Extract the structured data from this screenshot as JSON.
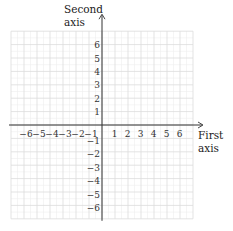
{
  "chart_data": {
    "type": "coordinate-plane",
    "title": "",
    "xlabel": [
      "First",
      "axis"
    ],
    "ylabel": [
      "Second",
      "axis"
    ],
    "xlim": [
      -7,
      7
    ],
    "ylim": [
      -7,
      7
    ],
    "grid": true,
    "minor_grid_step": 0.5,
    "major_grid_step": 1,
    "x_ticks": [
      -6,
      -5,
      -4,
      -3,
      -2,
      -1,
      1,
      2,
      3,
      4,
      5,
      6
    ],
    "y_ticks": [
      6,
      5,
      4,
      3,
      2,
      1,
      -1,
      -2,
      -3,
      -4,
      -5,
      -6
    ],
    "x_tick_labels": [
      "−6",
      "−5",
      "−4",
      "−3",
      "−2",
      "−1",
      "1",
      "2",
      "3",
      "4",
      "5",
      "6"
    ],
    "y_tick_labels": [
      "6",
      "5",
      "4",
      "3",
      "2",
      "1",
      "−1",
      "−2",
      "−3",
      "−4",
      "−5",
      "−6"
    ],
    "arrows": [
      "positive-x",
      "positive-y"
    ],
    "colors": {
      "axis": "#333333",
      "major_grid": "#dcdcdc",
      "minor_grid": "#efefef"
    }
  }
}
